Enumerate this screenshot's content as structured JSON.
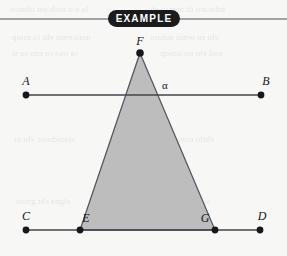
{
  "badge": {
    "label": "EXAMPLE",
    "background_color": "#1b1b1d",
    "text_color": "#ffffff",
    "x": 108,
    "y": 10,
    "width": 72,
    "height": 17
  },
  "figure": {
    "width": 287,
    "height": 256,
    "background_color": "#f7f7f6",
    "rule_y": 19,
    "rule_color": "#4f5156",
    "line_color": "#43454a",
    "point_color": "#17181c",
    "triangle_fill": "#bdbdbd",
    "triangle_stroke": "#56585d"
  },
  "points": [
    {
      "id": "A",
      "label": "A",
      "x": 26,
      "y": 95,
      "label_x": 26,
      "label_y": 85
    },
    {
      "id": "B",
      "label": "B",
      "x": 261,
      "y": 95,
      "label_x": 266,
      "label_y": 85
    },
    {
      "id": "C",
      "label": "C",
      "x": 26,
      "y": 230,
      "label_x": 26,
      "label_y": 220
    },
    {
      "id": "D",
      "label": "D",
      "x": 260,
      "y": 230,
      "label_x": 262,
      "label_y": 220
    },
    {
      "id": "E",
      "label": "E",
      "x": 80,
      "y": 230,
      "label_x": 86,
      "label_y": 222
    },
    {
      "id": "F",
      "label": "F",
      "x": 140,
      "y": 53,
      "label_x": 140,
      "label_y": 45
    },
    {
      "id": "G",
      "label": "G",
      "x": 215,
      "y": 230,
      "label_x": 205,
      "label_y": 222
    }
  ],
  "lines": [
    {
      "id": "AB",
      "name": "line-ab",
      "from": "A",
      "to": "B",
      "x1": 26,
      "y1": 95,
      "x2": 261,
      "y2": 95
    },
    {
      "id": "CD",
      "name": "line-cd",
      "from": "C",
      "to": "D",
      "x1": 26,
      "y1": 230,
      "x2": 260,
      "y2": 230
    }
  ],
  "triangle": {
    "id": "FEG",
    "vertices": [
      "F",
      "E",
      "G"
    ],
    "path": "M 140,53 L 80,230 L 215,230 Z",
    "fill": "#bdbdbd",
    "stroke": "#56585d"
  },
  "angle": {
    "label": "α",
    "at_vertex": "F",
    "x": 165,
    "y": 89
  },
  "bleed_text": [
    {
      "text": "la o u noth ien ttbarus",
      "x": 10,
      "y": 4,
      "size": 9
    },
    {
      "text": "mlocaro di mer to eb",
      "x": 150,
      "y": 4,
      "size": 9
    },
    {
      "text": "noitcestni eht fo tniop",
      "x": 12,
      "y": 32,
      "size": 9
    },
    {
      "text": "ebi ro semit nobiru",
      "x": 150,
      "y": 32,
      "size": 9
    },
    {
      "text": "sa owt ro eno sa si",
      "x": 12,
      "y": 48,
      "size": 9
    },
    {
      "text": "enil eht no stniop",
      "x": 160,
      "y": 48,
      "size": 9
    },
    {
      "text": "etanidrooc eht ni",
      "x": 14,
      "y": 134,
      "size": 9
    },
    {
      "text": "ehtfo erusaem eht",
      "x": 150,
      "y": 134,
      "size": 9
    },
    {
      "text": "elgna eht gnisu",
      "x": 16,
      "y": 196,
      "size": 9
    },
    {
      "text": "si hcihw elgnairt",
      "x": 150,
      "y": 196,
      "size": 9
    }
  ]
}
